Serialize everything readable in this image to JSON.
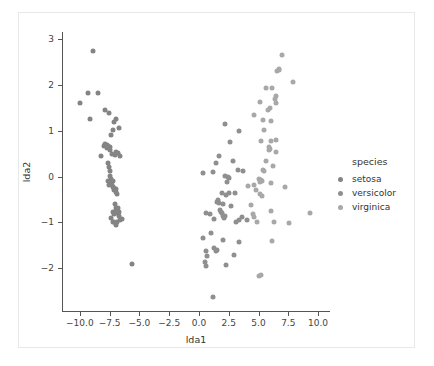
{
  "figure": {
    "background": "#ffffff",
    "border_color": "#e8e8e8",
    "axis_color": "#555555"
  },
  "axis": {
    "xlabel": "lda1",
    "ylabel": "lda2",
    "xticks": [
      "-10.0",
      "-7.5",
      "-5.0",
      "-2.5",
      "0.0",
      "2.5",
      "5.0",
      "7.5",
      "10.0"
    ],
    "yticks": [
      "-2",
      "-1",
      "0",
      "1",
      "2",
      "3"
    ]
  },
  "legend": {
    "title": "species",
    "entries": [
      {
        "label": "setosa",
        "color": "#848484"
      },
      {
        "label": "versicolor",
        "color": "#8f8f8f"
      },
      {
        "label": "virginica",
        "color": "#a8a8a8"
      }
    ]
  },
  "chart_data": {
    "type": "scatter",
    "title": "",
    "xlabel": "lda1",
    "ylabel": "lda2",
    "xlim": [
      -11.5,
      11.0
    ],
    "ylim": [
      -2.95,
      3.15
    ],
    "grid": false,
    "legend_position": "right",
    "legend_title": "species",
    "series": [
      {
        "name": "setosa",
        "color": "#848484",
        "points": [
          [
            -8.9,
            2.73
          ],
          [
            -9.95,
            1.61
          ],
          [
            -9.3,
            1.83
          ],
          [
            -8.45,
            1.83
          ],
          [
            -9.15,
            1.25
          ],
          [
            -7.85,
            1.46
          ],
          [
            -7.55,
            1.38
          ],
          [
            -6.95,
            1.25
          ],
          [
            -7.15,
            1.19
          ],
          [
            -7.25,
            1.02
          ],
          [
            -7.4,
            0.9
          ],
          [
            -8.0,
            0.66
          ],
          [
            -7.9,
            0.7
          ],
          [
            -7.75,
            0.68
          ],
          [
            -7.7,
            0.62
          ],
          [
            -7.6,
            0.66
          ],
          [
            -7.5,
            0.58
          ],
          [
            -7.45,
            0.64
          ],
          [
            -7.3,
            0.5
          ],
          [
            -7.05,
            0.47
          ],
          [
            -7.0,
            0.54
          ],
          [
            -6.8,
            0.52
          ],
          [
            -6.6,
            0.45
          ],
          [
            -6.75,
            1.06
          ],
          [
            -8.25,
            0.45
          ],
          [
            -7.6,
            0.3
          ],
          [
            -7.55,
            0.2
          ],
          [
            -7.5,
            0.12
          ],
          [
            -7.45,
            0.02
          ],
          [
            -7.4,
            -0.05
          ],
          [
            -7.35,
            -0.12
          ],
          [
            -7.3,
            -0.18
          ],
          [
            -7.25,
            -0.1
          ],
          [
            -7.2,
            -0.22
          ],
          [
            -7.15,
            -0.3
          ],
          [
            -7.1,
            -0.24
          ],
          [
            -7.0,
            -0.33
          ],
          [
            -6.95,
            -0.28
          ],
          [
            -6.85,
            -0.38
          ],
          [
            -7.55,
            -0.18
          ],
          [
            -7.6,
            -0.1
          ],
          [
            -7.05,
            -0.6
          ],
          [
            -7.0,
            -0.68
          ],
          [
            -6.95,
            -0.75
          ],
          [
            -6.9,
            -0.72
          ],
          [
            -6.85,
            -0.8
          ],
          [
            -6.8,
            -0.68
          ],
          [
            -6.75,
            -0.78
          ],
          [
            -6.7,
            -0.85
          ],
          [
            -7.15,
            -0.82
          ],
          [
            -7.25,
            -0.78
          ],
          [
            -7.35,
            -0.9
          ],
          [
            -7.2,
            -0.98
          ],
          [
            -7.1,
            -1.0
          ],
          [
            -7.0,
            -1.05
          ],
          [
            -6.9,
            -0.98
          ],
          [
            -6.6,
            -0.95
          ],
          [
            -6.5,
            -0.92
          ],
          [
            -5.6,
            -1.91
          ]
        ]
      },
      {
        "name": "versicolor",
        "color": "#8f8f8f",
        "points": [
          [
            0.35,
            0.07
          ],
          [
            1.15,
            0.1
          ],
          [
            2.2,
            1.15
          ],
          [
            2.6,
            0.75
          ],
          [
            1.7,
            0.45
          ],
          [
            1.45,
            0.3
          ],
          [
            2.2,
            0.02
          ],
          [
            2.4,
            0.0
          ],
          [
            2.5,
            -0.02
          ],
          [
            2.35,
            -0.12
          ],
          [
            2.55,
            -0.35
          ],
          [
            2.3,
            -0.4
          ],
          [
            1.9,
            -0.35
          ],
          [
            1.6,
            -0.5
          ],
          [
            1.5,
            -0.55
          ],
          [
            1.7,
            -0.58
          ],
          [
            2.0,
            -0.6
          ],
          [
            2.65,
            -0.65
          ],
          [
            1.75,
            -0.72
          ],
          [
            1.85,
            -0.78
          ],
          [
            1.95,
            -0.8
          ],
          [
            2.05,
            -0.85
          ],
          [
            2.2,
            -0.85
          ],
          [
            2.1,
            -0.9
          ],
          [
            1.3,
            -0.92
          ],
          [
            0.95,
            -0.82
          ],
          [
            0.6,
            -0.8
          ],
          [
            1.05,
            -1.22
          ],
          [
            0.35,
            -1.33
          ],
          [
            2.0,
            -1.38
          ],
          [
            1.3,
            -1.55
          ],
          [
            1.45,
            -1.62
          ],
          [
            1.55,
            -1.6
          ],
          [
            0.6,
            -1.62
          ],
          [
            0.65,
            -1.72
          ],
          [
            0.5,
            -1.85
          ],
          [
            0.6,
            -1.95
          ],
          [
            2.25,
            -1.92
          ],
          [
            2.9,
            -1.7
          ],
          [
            3.4,
            -1.42
          ],
          [
            1.2,
            -2.63
          ],
          [
            3.1,
            -1.0
          ],
          [
            3.35,
            -0.95
          ],
          [
            3.65,
            -0.88
          ],
          [
            4.05,
            -0.95
          ],
          [
            3.25,
            0.15
          ],
          [
            3.7,
            0.13
          ],
          [
            3.35,
            1.0
          ],
          [
            2.85,
            0.35
          ],
          [
            3.05,
            -0.35
          ]
        ]
      },
      {
        "name": "virginica",
        "color": "#a8a8a8",
        "points": [
          [
            6.95,
            2.65
          ],
          [
            6.7,
            2.33
          ],
          [
            6.55,
            2.3
          ],
          [
            6.75,
            2.35
          ],
          [
            7.9,
            2.05
          ],
          [
            5.65,
            1.92
          ],
          [
            6.1,
            1.93
          ],
          [
            6.45,
            1.75
          ],
          [
            6.4,
            1.68
          ],
          [
            6.5,
            1.6
          ],
          [
            5.15,
            1.62
          ],
          [
            6.0,
            1.5
          ],
          [
            5.8,
            1.44
          ],
          [
            4.65,
            1.35
          ],
          [
            5.35,
            1.24
          ],
          [
            6.05,
            1.22
          ],
          [
            5.5,
            1.02
          ],
          [
            5.2,
            0.78
          ],
          [
            6.5,
            0.8
          ],
          [
            6.05,
            0.78
          ],
          [
            5.9,
            0.65
          ],
          [
            5.85,
            0.58
          ],
          [
            5.95,
            0.6
          ],
          [
            6.5,
            0.53
          ],
          [
            5.6,
            0.35
          ],
          [
            6.2,
            0.22
          ],
          [
            5.4,
            0.15
          ],
          [
            5.5,
            0.13
          ],
          [
            5.05,
            -0.05
          ],
          [
            5.2,
            -0.07
          ],
          [
            5.3,
            -0.1
          ],
          [
            5.15,
            -0.12
          ],
          [
            6.05,
            -0.13
          ],
          [
            4.6,
            -0.18
          ],
          [
            7.25,
            -0.22
          ],
          [
            4.8,
            -0.3
          ],
          [
            5.1,
            -0.38
          ],
          [
            5.3,
            -0.42
          ],
          [
            4.65,
            -0.88
          ],
          [
            4.5,
            -0.82
          ],
          [
            4.35,
            -0.62
          ],
          [
            4.9,
            -1.0
          ],
          [
            6.3,
            -1.0
          ],
          [
            7.55,
            -1.02
          ],
          [
            6.05,
            -0.75
          ],
          [
            6.1,
            -1.4
          ],
          [
            5.0,
            -2.16
          ],
          [
            5.2,
            -2.15
          ],
          [
            9.3,
            -0.8
          ],
          [
            4.1,
            -0.2
          ]
        ]
      }
    ]
  }
}
